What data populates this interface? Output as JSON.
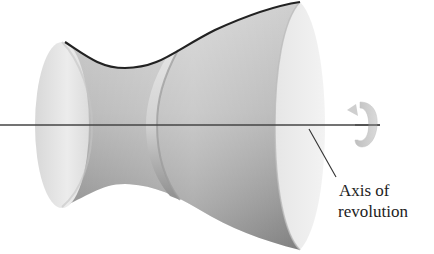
{
  "figure": {
    "type": "surface-of-revolution-diagram",
    "label": {
      "line1": "Axis of",
      "line2": "revolution"
    },
    "icons": {
      "rotation_arrow": "rotation-arrow-icon"
    },
    "colors": {
      "background": "#ffffff",
      "surface_light": "#ececec",
      "surface_mid": "#bdbdbd",
      "surface_dark": "#8a8a8a",
      "profile_curve": "#222222",
      "axis": "#444444",
      "arrow": "#c8c8c8",
      "text": "#222222"
    }
  }
}
